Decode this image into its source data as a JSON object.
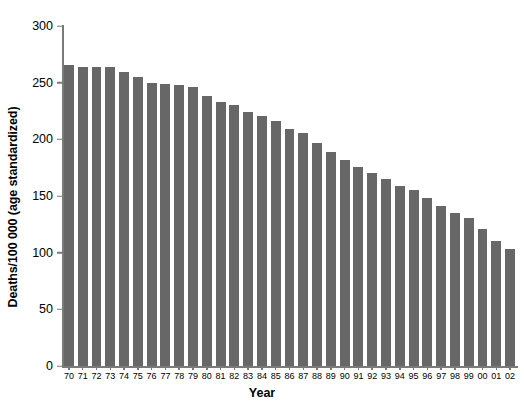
{
  "chart_data": {
    "type": "bar",
    "title": "",
    "subtitle": "",
    "xlabel": "Year",
    "ylabel": "Deaths/100 000 (age standardized)",
    "categories": [
      "70",
      "71",
      "72",
      "73",
      "74",
      "75",
      "76",
      "77",
      "78",
      "79",
      "80",
      "81",
      "82",
      "83",
      "84",
      "85",
      "86",
      "87",
      "88",
      "89",
      "90",
      "91",
      "92",
      "93",
      "94",
      "95",
      "96",
      "97",
      "98",
      "99",
      "00",
      "01",
      "02"
    ],
    "values": [
      266,
      264,
      264,
      264,
      259,
      255,
      250,
      249,
      248,
      246,
      238,
      233,
      230,
      224,
      221,
      216,
      209,
      206,
      197,
      189,
      182,
      176,
      170,
      165,
      159,
      155,
      148,
      141,
      135,
      131,
      121,
      110,
      103
    ],
    "series": [
      {
        "name": "Deaths/100 000 (age standardized)",
        "values": [
          266,
          264,
          264,
          264,
          259,
          255,
          250,
          249,
          248,
          246,
          238,
          233,
          230,
          224,
          221,
          216,
          209,
          206,
          197,
          189,
          182,
          176,
          170,
          165,
          159,
          155,
          148,
          141,
          135,
          131,
          121,
          110,
          103
        ]
      }
    ],
    "ylim": [
      0,
      300
    ],
    "yticks": [
      0,
      50,
      100,
      150,
      200,
      250,
      300
    ],
    "ytick_labels": [
      "0",
      "50",
      "100",
      "150",
      "200",
      "250",
      "300"
    ],
    "xtick_labels": [
      "70",
      "71",
      "72",
      "73",
      "74",
      "75",
      "76",
      "77",
      "78",
      "79",
      "80",
      "81",
      "82",
      "83",
      "84",
      "85",
      "86",
      "87",
      "88",
      "89",
      "90",
      "91",
      "92",
      "93",
      "94",
      "95",
      "96",
      "97",
      "98",
      "99",
      "00",
      "01",
      "02"
    ],
    "grid": false,
    "legend": false,
    "legend_position": "none",
    "bar_color": "#676767",
    "axis_color": "#7a7a7a",
    "background_color": "#ffffff",
    "text_color": "#000000"
  }
}
